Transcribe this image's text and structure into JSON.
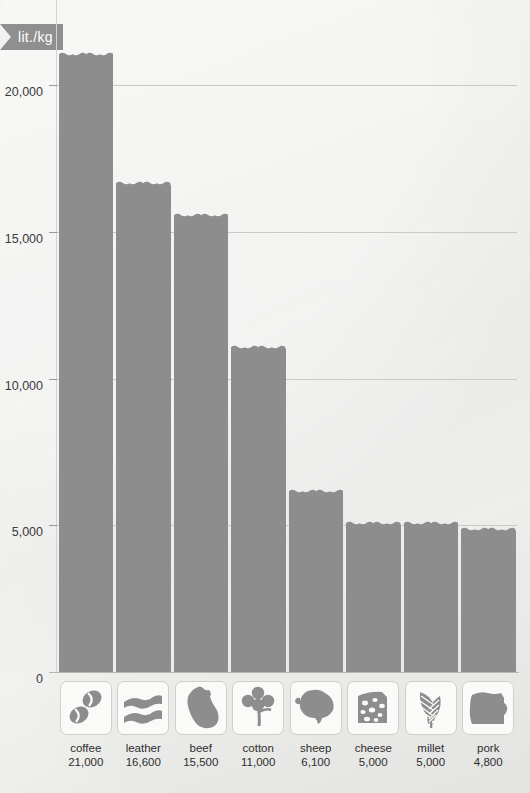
{
  "unit_banner": {
    "label": "lit./kg"
  },
  "chart_data": {
    "type": "bar",
    "title": "",
    "subtitle": "",
    "xlabel": "",
    "ylabel": "lit./kg",
    "ylim": [
      0,
      22000
    ],
    "grid": true,
    "legend": "none",
    "orientation": "vertical",
    "bar_color": "#8d8d8d",
    "categories": [
      "coffee",
      "leather",
      "beef",
      "cotton",
      "sheep",
      "cheese",
      "millet",
      "pork"
    ],
    "values": [
      21000,
      16600,
      15500,
      11000,
      6100,
      5000,
      5000,
      4800
    ],
    "value_labels": [
      "21,000",
      "16,600",
      "15,500",
      "11,000",
      "6,100",
      "5,000",
      "5,000",
      "4,800"
    ],
    "yticks": [
      0,
      5000,
      10000,
      15000,
      20000
    ],
    "ytick_labels": [
      "0",
      "5,000",
      "10,000",
      "15,000",
      "20,000"
    ],
    "icons": [
      "coffee-beans-icon",
      "leather-hide-icon",
      "beef-cut-icon",
      "cotton-flower-icon",
      "sheep-icon",
      "cheese-wedge-icon",
      "millet-stalks-icon",
      "pork-cut-icon"
    ]
  }
}
